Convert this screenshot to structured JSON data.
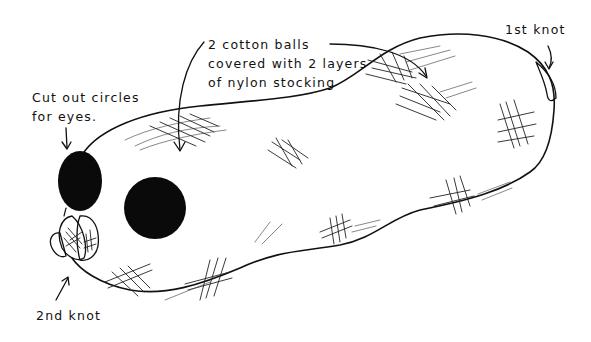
{
  "diagram": {
    "labels": {
      "cotton_balls": "2 cotton balls\ncovered with 2 layers\nof nylon stocking",
      "eyes": "Cut out circles\nfor eyes.",
      "first_knot": "1st knot",
      "second_knot": "2nd knot"
    },
    "colors": {
      "ink": "#111111",
      "background": "#ffffff"
    }
  }
}
